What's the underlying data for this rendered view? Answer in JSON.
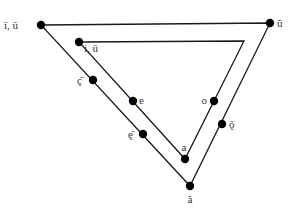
{
  "diagram": {
    "stroke_color": "#1a1a1a",
    "point_color": "#000000",
    "outer_triangle": {
      "vertices": [
        [
          41,
          25
        ],
        [
          270,
          23
        ],
        [
          190,
          186
        ]
      ]
    },
    "inner_triangle": {
      "vertices": [
        [
          79,
          42
        ],
        [
          244,
          41
        ],
        [
          185,
          159
        ]
      ]
    },
    "points": [
      {
        "id": "outer-top-left",
        "label": "ī, ū",
        "x": 41,
        "y": 25,
        "lx": 4,
        "ly": 29,
        "anchor": "start"
      },
      {
        "id": "outer-top-right",
        "label": "ũ",
        "x": 270,
        "y": 23,
        "lx": 277,
        "ly": 27,
        "anchor": "start"
      },
      {
        "id": "inner-top-left",
        "label": "i, ū",
        "x": 79,
        "y": 42,
        "lx": 84,
        "ly": 52,
        "anchor": "start"
      },
      {
        "id": "outer-left-mid",
        "label": "ç̄",
        "x": 93,
        "y": 80,
        "lx": 82,
        "ly": 84,
        "anchor": "end"
      },
      {
        "id": "inner-left-mid",
        "label": "e",
        "x": 133,
        "y": 101,
        "lx": 139,
        "ly": 104,
        "anchor": "start"
      },
      {
        "id": "outer-left-low",
        "label": "ę̄",
        "x": 143,
        "y": 134,
        "lx": 133,
        "ly": 138,
        "anchor": "end"
      },
      {
        "id": "inner-bottom",
        "label": "a",
        "x": 185,
        "y": 159,
        "lx": 184,
        "ly": 151,
        "anchor": "middle"
      },
      {
        "id": "outer-bottom",
        "label": "ã",
        "x": 190,
        "y": 186,
        "lx": 190,
        "ly": 203,
        "anchor": "middle"
      },
      {
        "id": "inner-right-mid",
        "label": "o",
        "x": 214,
        "y": 101,
        "lx": 207,
        "ly": 104,
        "anchor": "end"
      },
      {
        "id": "outer-right-mid",
        "label": "ǭ",
        "x": 222,
        "y": 124,
        "lx": 229,
        "ly": 128,
        "anchor": "start"
      }
    ]
  }
}
